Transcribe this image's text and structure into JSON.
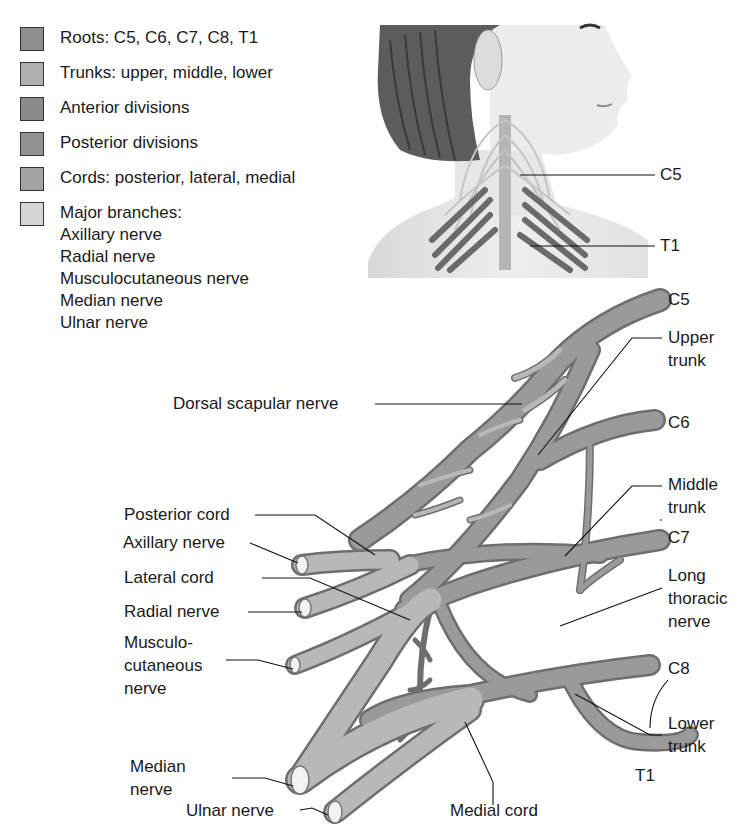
{
  "legend": {
    "items": [
      {
        "label": "Roots: C5, C6, C7, C8, T1",
        "color": "#8f8f8f"
      },
      {
        "label": "Trunks: upper, middle, lower",
        "color": "#b0b0b0"
      },
      {
        "label": "Anterior divisions",
        "color": "#8a8a8a"
      },
      {
        "label": "Posterior divisions",
        "color": "#919191"
      },
      {
        "label": "Cords: posterior, lateral, medial",
        "color": "#a3a3a3"
      },
      {
        "label": "Major branches:",
        "color": "#d6d6d6"
      }
    ],
    "branches": [
      "Axillary nerve",
      "Radial nerve",
      "Musculocutaneous nerve",
      "Median nerve",
      "Ulnar nerve"
    ]
  },
  "inset": {
    "labels": {
      "c5": "C5",
      "t1": "T1"
    }
  },
  "diagram": {
    "roots": {
      "c5": "C5",
      "c6": "C6",
      "c7": "C7",
      "c8": "C8",
      "t1": "T1"
    },
    "labels": {
      "dorsal_scapular": "Dorsal scapular nerve",
      "upper_trunk": [
        "Upper",
        "trunk"
      ],
      "middle_trunk": [
        "Middle",
        "trunk"
      ],
      "long_thoracic": [
        "Long",
        "thoracic",
        "nerve"
      ],
      "lower_trunk": [
        "Lower",
        "trunk"
      ],
      "posterior_cord": "Posterior cord",
      "axillary": "Axillary nerve",
      "lateral_cord": "Lateral cord",
      "radial": "Radial nerve",
      "musculocutaneous": [
        "Musculo-",
        "cutaneous",
        "nerve"
      ],
      "median": [
        "Median",
        "nerve"
      ],
      "ulnar": "Ulnar nerve",
      "medial_cord": "Medial cord"
    }
  }
}
